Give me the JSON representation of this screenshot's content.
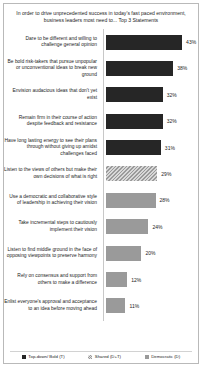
{
  "chart_data": {
    "type": "bar",
    "orientation": "horizontal",
    "title": "In order to drive unprecedented success in today's fast paced environment, business leaders most need to... Top 3 Statements",
    "xlabel": "",
    "ylabel": "",
    "xlim": [
      0,
      50
    ],
    "grid": false,
    "legend_position": "bottom",
    "categories": [
      "Dare to be different and willing to challenge  general opinion",
      "Be bold risk-takers  that pursue unpopular or unconventional ideas to break new ground",
      "Envision audacious ideas that don't yet exist",
      "Remain firm in their course of action despite feedback and resistance",
      "Have long lasting energy to see their plans through without giving up amidst challenges faced",
      "Listen to the views of others but make their own decisions of what is right",
      "Use a democratic and collaborative style of leadership  in achieving their vision",
      "Take incremental steps to cautiously implement their vision",
      "Listen to find middle ground in the face of opposing viewpoints  to preserve harmony",
      "Rely on consensus and support from others to make a difference",
      "Enlist everyone's approval and acceptance to an idea before moving ahead"
    ],
    "values": [
      43,
      38,
      32,
      32,
      31,
      29,
      28,
      24,
      20,
      12,
      11
    ],
    "value_labels": [
      "43%",
      "38%",
      "32%",
      "32%",
      "31%",
      "29%",
      "28%",
      "24%",
      "20%",
      "12%",
      "11%"
    ],
    "series_of_bar": [
      "topdown",
      "topdown",
      "topdown",
      "topdown",
      "topdown",
      "shared",
      "democratic",
      "democratic",
      "democratic",
      "democratic",
      "democratic"
    ],
    "legend": [
      {
        "key": "topdown",
        "label": "Top-down/ Bold (T)",
        "color": "#262626"
      },
      {
        "key": "shared",
        "label": "Shared (D+T)",
        "color": "#9a9a9a"
      },
      {
        "key": "democratic",
        "label": "Democratic (D)",
        "color": "#9a9a9a"
      }
    ]
  }
}
